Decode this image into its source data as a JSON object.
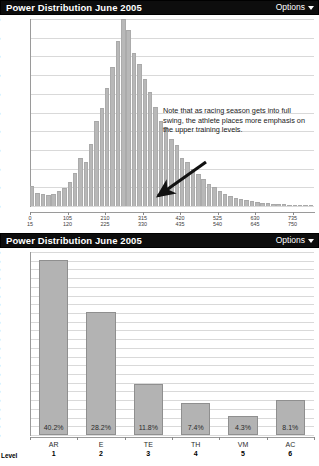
{
  "panels": [
    {
      "title": "Power Distribution June 2005",
      "options_label": "Options",
      "options_icon": "chevron-down-icon"
    },
    {
      "title": "Power Distribution June 2005",
      "options_label": "Options",
      "options_icon": "chevron-down-icon"
    }
  ],
  "annotation": {
    "text": "Note that as racing season gets into full swing, the athlete places more emphasis on the upper training levels.",
    "arrow": "arrow-pointing-down-left"
  },
  "axis_caption": "Level",
  "chart_data": [
    {
      "type": "bar",
      "title": "Power Distribution June 2005",
      "xlabel": "",
      "ylabel": "",
      "ylim": [
        0,
        10
      ],
      "ytick_labels": [
        "10%",
        "9%",
        "8%",
        "7%",
        "6%",
        "5%",
        "4%",
        "3%",
        "2%",
        "1%",
        "0%"
      ],
      "yticks": [
        10,
        9,
        8,
        7,
        6,
        5,
        4,
        3,
        2,
        1,
        0
      ],
      "grid": true,
      "legend": "none",
      "xtick_labels": [
        [
          "0",
          "15"
        ],
        [
          "105",
          "120"
        ],
        [
          "210",
          "225"
        ],
        [
          "315",
          "330"
        ],
        [
          "420",
          "435"
        ],
        [
          "525",
          "540"
        ],
        [
          "630",
          "645"
        ],
        [
          "735",
          "750"
        ]
      ],
      "xtick_positions": [
        0,
        105,
        210,
        315,
        420,
        525,
        630,
        735
      ],
      "xlim": [
        0,
        795
      ],
      "bin_width": 15,
      "x": [
        0,
        15,
        30,
        45,
        60,
        75,
        90,
        105,
        120,
        135,
        150,
        165,
        180,
        195,
        210,
        225,
        240,
        255,
        270,
        285,
        300,
        315,
        330,
        345,
        360,
        375,
        390,
        405,
        420,
        435,
        450,
        465,
        480,
        495,
        510,
        525,
        540,
        555,
        570,
        585,
        600,
        615,
        630,
        645,
        660,
        675,
        690,
        705,
        720,
        735,
        750,
        765,
        780
      ],
      "values": [
        1.05,
        0.72,
        0.62,
        0.6,
        0.62,
        0.78,
        0.95,
        1.3,
        1.75,
        2.55,
        2.35,
        3.3,
        4.55,
        5.25,
        6.3,
        7.45,
        8.8,
        10.0,
        9.4,
        8.2,
        7.6,
        6.8,
        6.1,
        5.3,
        4.55,
        4.2,
        3.6,
        3.25,
        2.55,
        2.35,
        2.0,
        1.7,
        1.45,
        1.2,
        1.0,
        0.82,
        0.66,
        0.54,
        0.44,
        0.36,
        0.3,
        0.25,
        0.2,
        0.17,
        0.14,
        0.12,
        0.1,
        0.09,
        0.08,
        0.07,
        0.06,
        0.05,
        0.04
      ]
    },
    {
      "type": "bar",
      "title": "Power Distribution June 2005",
      "xlabel": "Level",
      "ylabel": "",
      "ylim": [
        0,
        42
      ],
      "grid": true,
      "legend": "none",
      "ytick_labels": [
        "42%",
        "40%",
        "38%",
        "36%",
        "34%",
        "32%",
        "30%",
        "28%",
        "26%",
        "24%",
        "22%",
        "20%",
        "18%",
        "16%",
        "14%",
        "12%",
        "10%",
        "8%",
        "6%",
        "4%",
        "2%",
        "0%"
      ],
      "yticks": [
        42,
        40,
        38,
        36,
        34,
        32,
        30,
        28,
        26,
        24,
        22,
        20,
        18,
        16,
        14,
        12,
        10,
        8,
        6,
        4,
        2,
        0
      ],
      "categories": [
        "AR",
        "E",
        "TE",
        "TH",
        "VM",
        "AC"
      ],
      "levels": [
        "1",
        "2",
        "3",
        "4",
        "5",
        "6"
      ],
      "values": [
        40.2,
        28.2,
        11.8,
        7.4,
        4.3,
        8.1
      ],
      "data_labels": [
        "40.2%",
        "28.2%",
        "11.8%",
        "7.4%",
        "4.3%",
        "8.1%"
      ]
    }
  ]
}
